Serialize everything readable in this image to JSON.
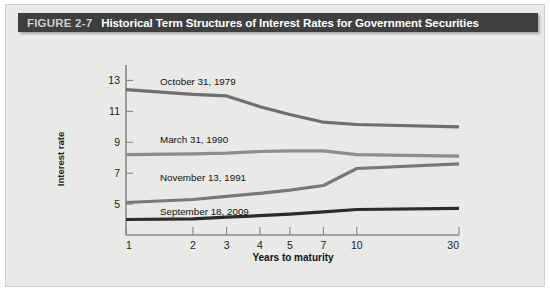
{
  "figure": {
    "number_label": "FIGURE 2-7",
    "title": "Historical Term Structures of Interest Rates for Government Securities"
  },
  "chart_data": {
    "type": "line",
    "title": "Historical Term Structures of Interest Rates for Government Securities",
    "xlabel": "Years to maturity",
    "ylabel": "Interest rate",
    "categories": [
      "1",
      "2",
      "3",
      "4",
      "5",
      "7",
      "10",
      "30"
    ],
    "x_tick_labels": [
      "1",
      "2",
      "3",
      "4",
      "5",
      "7",
      "10",
      "30"
    ],
    "y_tick_labels": [
      "13",
      "11",
      "9",
      "7",
      "5"
    ],
    "y_ticks": [
      13,
      11,
      9,
      7,
      5
    ],
    "ylim": [
      3,
      14
    ],
    "grid": false,
    "legend_position": "inline-labels",
    "series": [
      {
        "name": "October 31, 1979",
        "color": "#6e6e6e",
        "label_x_px": 34,
        "label_y_px": 20,
        "values": [
          12.4,
          12.1,
          12.0,
          11.3,
          10.8,
          10.3,
          10.15,
          10.0
        ]
      },
      {
        "name": "March 31, 1990",
        "color": "#8d8d8d",
        "label_x_px": 34,
        "label_y_px": 78,
        "values": [
          8.2,
          8.25,
          8.3,
          8.4,
          8.45,
          8.45,
          8.2,
          8.1
        ]
      },
      {
        "name": "November 13, 1991",
        "color": "#787878",
        "label_x_px": 34,
        "label_y_px": 116,
        "values": [
          5.1,
          5.3,
          5.5,
          5.7,
          5.9,
          6.2,
          7.3,
          7.6
        ]
      },
      {
        "name": "September 18, 2009",
        "color": "#2b2b2b",
        "label_x_px": 34,
        "label_y_px": 150,
        "values": [
          4.0,
          4.05,
          4.15,
          4.25,
          4.35,
          4.5,
          4.65,
          4.72
        ]
      }
    ]
  },
  "colors": {
    "card_background": "#e9e9e7",
    "title_bar": "#3f3f3f",
    "figure_number_text": "#cfcfcf",
    "title_text": "#ffffff",
    "axis": "#8a8a88"
  }
}
